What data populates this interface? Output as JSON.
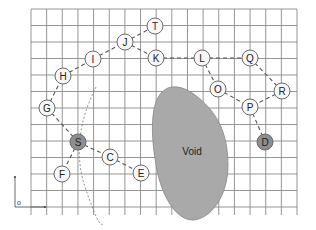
{
  "diagram": {
    "title": "",
    "grid": {
      "columns": 17,
      "rows": 12
    },
    "void": {
      "label": "Void",
      "fill": "#a9a9a9",
      "stroke": "#888888"
    },
    "origin_label": "o",
    "colors": {
      "node_fill": "#f7f7f7",
      "special_node_fill": "#8e8e8e",
      "grid": "#8a8a8a",
      "edge": "#555555"
    },
    "nodes": [
      {
        "id": "T",
        "label": "T",
        "special": false
      },
      {
        "id": "J",
        "label": "J",
        "special": false
      },
      {
        "id": "K",
        "label": "K",
        "special": false
      },
      {
        "id": "L",
        "label": "L",
        "special": false
      },
      {
        "id": "Q",
        "label": "Q",
        "special": false
      },
      {
        "id": "I",
        "label": "I",
        "special": false
      },
      {
        "id": "H",
        "label": "H",
        "special": false
      },
      {
        "id": "G",
        "label": "G",
        "special": false
      },
      {
        "id": "S",
        "label": "S",
        "special": true
      },
      {
        "id": "F",
        "label": "F",
        "special": false
      },
      {
        "id": "C",
        "label": "C",
        "special": false
      },
      {
        "id": "E",
        "label": "E",
        "special": false
      },
      {
        "id": "O",
        "label": "O",
        "special": false
      },
      {
        "id": "R",
        "label": "R",
        "special": false
      },
      {
        "id": "P",
        "label": "P",
        "special": false
      },
      {
        "id": "D",
        "label": "D",
        "special": true
      }
    ],
    "edges": [
      [
        "J",
        "T"
      ],
      [
        "J",
        "K"
      ],
      [
        "I",
        "J"
      ],
      [
        "H",
        "I"
      ],
      [
        "G",
        "H"
      ],
      [
        "G",
        "S"
      ],
      [
        "S",
        "F"
      ],
      [
        "S",
        "C"
      ],
      [
        "C",
        "E"
      ],
      [
        "K",
        "L"
      ],
      [
        "L",
        "Q"
      ],
      [
        "L",
        "O"
      ],
      [
        "O",
        "P"
      ],
      [
        "Q",
        "R"
      ],
      [
        "R",
        "P"
      ],
      [
        "P",
        "D"
      ]
    ]
  }
}
